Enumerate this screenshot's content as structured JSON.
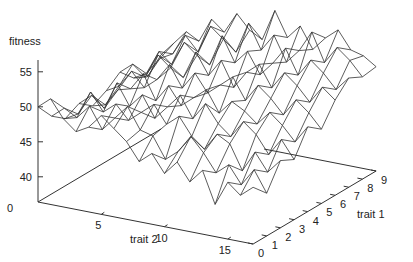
{
  "chart_data": {
    "type": "surface",
    "title": "",
    "zlabel": "fitness",
    "xlabel": "trait 2",
    "ylabel": "trait 1",
    "x_range": [
      0,
      17
    ],
    "y_range": [
      0,
      9
    ],
    "x_ticks": [
      5,
      10,
      15
    ],
    "y_ticks": [
      0,
      1,
      2,
      3,
      4,
      5,
      6,
      7,
      8,
      9
    ],
    "z_ticks": [
      40,
      45,
      50,
      55
    ],
    "z_base_label": "0",
    "grid": false,
    "legend": null,
    "colors": {
      "line": "#333333",
      "axis": "#333333",
      "text": "#222222"
    },
    "z_values": [
      [
        50.0,
        47.5,
        46.0,
        47.0,
        45.5,
        46.5,
        48.0,
        46.0,
        45.0,
        47.0
      ],
      [
        51.5,
        49.0,
        47.0,
        48.5,
        46.0,
        47.5,
        49.5,
        47.0,
        48.0,
        49.0
      ],
      [
        49.0,
        48.0,
        50.5,
        47.0,
        48.5,
        50.0,
        48.0,
        50.5,
        49.0,
        51.0
      ],
      [
        47.5,
        50.0,
        48.0,
        51.0,
        49.0,
        48.0,
        51.5,
        49.0,
        52.0,
        50.0
      ],
      [
        48.5,
        47.0,
        49.5,
        48.0,
        51.5,
        49.5,
        50.0,
        52.5,
        50.0,
        53.5
      ],
      [
        50.5,
        49.0,
        47.5,
        50.0,
        48.0,
        52.0,
        49.0,
        51.0,
        54.0,
        52.0
      ],
      [
        49.0,
        51.0,
        49.0,
        47.0,
        50.5,
        49.0,
        53.0,
        50.0,
        52.5,
        55.0
      ],
      [
        47.5,
        48.0,
        50.5,
        49.0,
        48.0,
        51.5,
        50.0,
        54.5,
        51.0,
        53.0
      ],
      [
        45.0,
        47.5,
        48.0,
        51.0,
        49.5,
        49.0,
        52.5,
        51.0,
        55.5,
        52.0
      ],
      [
        46.5,
        44.5,
        49.5,
        48.0,
        51.0,
        50.5,
        49.0,
        53.0,
        52.0,
        56.5
      ],
      [
        44.0,
        46.0,
        47.0,
        50.5,
        48.0,
        52.0,
        51.5,
        50.0,
        54.5,
        53.0
      ],
      [
        46.0,
        48.5,
        45.5,
        48.0,
        50.0,
        49.0,
        53.0,
        52.0,
        51.0,
        55.0
      ],
      [
        43.5,
        46.5,
        48.0,
        46.5,
        49.0,
        51.5,
        50.0,
        54.5,
        53.0,
        52.0
      ],
      [
        45.5,
        44.0,
        47.0,
        49.0,
        47.5,
        50.0,
        52.5,
        51.0,
        56.0,
        54.0
      ],
      [
        41.0,
        45.5,
        43.5,
        47.5,
        49.5,
        48.0,
        51.0,
        53.5,
        52.0,
        55.5
      ],
      [
        44.5,
        43.0,
        46.5,
        45.0,
        48.0,
        50.5,
        49.0,
        52.0,
        54.5,
        53.0
      ],
      [
        43.0,
        45.5,
        44.0,
        47.5,
        46.0,
        49.0,
        51.5,
        50.0,
        53.0,
        52.5
      ],
      [
        44.5,
        42.5,
        46.0,
        45.0,
        48.5,
        47.0,
        50.0,
        52.0,
        51.0,
        51.3
      ]
    ]
  },
  "projection": {
    "origin": [
      38,
      202
    ],
    "x_step": [
      12.65,
      2.47
    ],
    "y_step": [
      13.67,
      -8.11
    ],
    "z_base": 36.4,
    "z_scale": 7.0
  }
}
